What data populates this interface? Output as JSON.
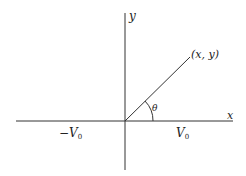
{
  "diagram": {
    "title": "",
    "colors": {
      "line": "#333333",
      "text": "#222222",
      "background": "#ffffff"
    },
    "axes": {
      "x_label": "x",
      "y_label": "y"
    },
    "point_label": "(x, y)",
    "angle_label": "θ",
    "left_label": {
      "prefix": "−V",
      "subscript": "0"
    },
    "right_label": {
      "prefix": "V",
      "subscript": "0"
    }
  }
}
